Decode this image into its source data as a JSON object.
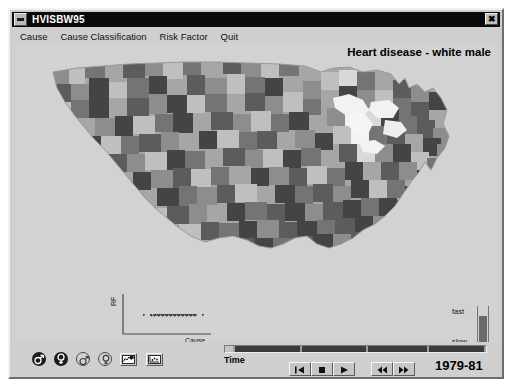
{
  "window": {
    "title": "HVISBW95",
    "menu_icon": "window-menu-icon",
    "close_label": "✖"
  },
  "menubar": {
    "items": [
      {
        "label": "Cause",
        "name": "menu-cause"
      },
      {
        "label": "Cause Classification",
        "name": "menu-cause-classification"
      },
      {
        "label": "Risk Factor",
        "name": "menu-risk-factor"
      },
      {
        "label": "Quit",
        "name": "menu-quit"
      }
    ]
  },
  "map": {
    "heading": "Heart disease - white male",
    "description": "Grayscale county-level choropleth map of the contiguous United States",
    "palette": [
      "#f2f2f2",
      "#d8d8d8",
      "#bfbfbf",
      "#a6a6a6",
      "#8d8d8d",
      "#747474",
      "#5c5c5c",
      "#444444"
    ],
    "background": "#d2d2d2"
  },
  "scatter": {
    "ylabel": "RF",
    "xlabel": "Cause",
    "type": "scatter"
  },
  "speed": {
    "fast_label": "fast",
    "slow_label": "slow",
    "decrease_label": "–",
    "increase_label": "+",
    "fill_percent": 71
  },
  "toolbar": {
    "icons": [
      {
        "name": "male-filled-icon",
        "glyph": "male",
        "style": "filled",
        "active": true
      },
      {
        "name": "female-filled-icon",
        "glyph": "female",
        "style": "filled",
        "active": true
      },
      {
        "name": "male-outline-icon",
        "glyph": "male",
        "style": "outlined",
        "active": false
      },
      {
        "name": "female-outline-icon",
        "glyph": "female",
        "style": "outlined",
        "active": false
      },
      {
        "name": "map-view-icon",
        "glyph": "map",
        "style": "square",
        "active": false
      },
      {
        "name": "scatter-view-icon",
        "glyph": "scatter",
        "style": "square",
        "active": false
      }
    ]
  },
  "time": {
    "label": "Time",
    "period": "1979-81",
    "segments": [
      {
        "name": "segment-0",
        "width": 8,
        "state": "empty"
      },
      {
        "name": "segment-1",
        "width": 66,
        "state": "filled"
      },
      {
        "name": "segment-2",
        "width": 66,
        "state": "filled"
      },
      {
        "name": "segment-3",
        "width": 60,
        "state": "filled"
      },
      {
        "name": "segment-4",
        "width": 56,
        "state": "filled"
      }
    ],
    "transport_primary": [
      {
        "name": "rewind-to-start-button",
        "glyph": "skip-back"
      },
      {
        "name": "stop-button",
        "glyph": "stop"
      },
      {
        "name": "play-button",
        "glyph": "play"
      }
    ],
    "transport_secondary": [
      {
        "name": "step-back-button",
        "glyph": "step-back"
      },
      {
        "name": "step-forward-button",
        "glyph": "step-forward"
      }
    ]
  },
  "colors": {
    "window_face": "#cfcfcf",
    "canvas": "#d2d2d2",
    "titlebar": "#0a0a0a",
    "title_text": "#ffffff"
  }
}
